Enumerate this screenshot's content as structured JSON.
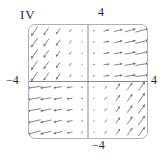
{
  "figure": {
    "panel_label": "IV",
    "axis_labels": {
      "top": "4",
      "right": "4",
      "left": "−4",
      "bottom": "−4"
    }
  },
  "chart_data": {
    "type": "vector_field",
    "title": "",
    "xlabel": "",
    "ylabel": "",
    "xlim": [
      -4,
      4
    ],
    "ylim": [
      -4,
      4
    ],
    "x_ticks_shown": {
      "min_label": "−4",
      "max_label": "4"
    },
    "y_ticks_shown": {
      "min_label": "−4",
      "max_label": "4"
    },
    "grid_x": [
      -3.6,
      -2.8,
      -2.0,
      -1.2,
      -0.4,
      0.4,
      1.2,
      2.0,
      2.8,
      3.6
    ],
    "grid_y": [
      -3.6,
      -2.8,
      -2.0,
      -1.2,
      -0.4,
      0.4,
      1.2,
      2.0,
      2.8,
      3.6
    ],
    "frame": "rounded-box",
    "axes_through_origin": true,
    "colors": {
      "arrow": "#6f6f6f",
      "axis": "#7a7a7a",
      "frame": "#b0b0b0",
      "text": "#2b2b2b",
      "background": "#ffffff"
    },
    "vectors": [
      [
        -3.6,
        3.6,
        -0.31,
        -0.442
      ],
      [
        -2.8,
        3.6,
        -0.241,
        -0.344
      ],
      [
        -2.0,
        3.6,
        -0.172,
        -0.246
      ],
      [
        -1.2,
        3.6,
        -0.103,
        -0.147
      ],
      [
        -0.4,
        3.6,
        -0.034,
        -0.049
      ],
      [
        0.4,
        3.6,
        0.076,
        0.02
      ],
      [
        1.2,
        3.6,
        0.228,
        0.06
      ],
      [
        2.0,
        3.6,
        0.38,
        0.1
      ],
      [
        2.8,
        3.6,
        0.532,
        0.14
      ],
      [
        3.6,
        3.6,
        0.684,
        0.181
      ],
      [
        -3.6,
        2.8,
        -0.31,
        -0.442
      ],
      [
        -2.8,
        2.8,
        -0.241,
        -0.344
      ],
      [
        -2.0,
        2.8,
        -0.172,
        -0.246
      ],
      [
        -1.2,
        2.8,
        -0.103,
        -0.147
      ],
      [
        -0.4,
        2.8,
        -0.034,
        -0.049
      ],
      [
        0.4,
        2.8,
        0.076,
        0.018
      ],
      [
        1.2,
        2.8,
        0.228,
        0.053
      ],
      [
        2.0,
        2.8,
        0.38,
        0.088
      ],
      [
        2.8,
        2.8,
        0.532,
        0.123
      ],
      [
        3.6,
        2.8,
        0.684,
        0.159
      ],
      [
        -3.6,
        2.0,
        -0.31,
        -0.442
      ],
      [
        -2.8,
        2.0,
        -0.241,
        -0.344
      ],
      [
        -2.0,
        2.0,
        -0.172,
        -0.246
      ],
      [
        -1.2,
        2.0,
        -0.103,
        -0.147
      ],
      [
        -0.4,
        2.0,
        -0.034,
        -0.049
      ],
      [
        0.4,
        2.0,
        0.076,
        0.015
      ],
      [
        1.2,
        2.0,
        0.228,
        0.046
      ],
      [
        2.0,
        2.0,
        0.38,
        0.076
      ],
      [
        2.8,
        2.0,
        0.532,
        0.106
      ],
      [
        3.6,
        2.0,
        0.684,
        0.137
      ],
      [
        -3.6,
        1.2,
        -0.31,
        -0.442
      ],
      [
        -2.8,
        1.2,
        -0.241,
        -0.344
      ],
      [
        -2.0,
        1.2,
        -0.172,
        -0.246
      ],
      [
        -1.2,
        1.2,
        -0.103,
        -0.147
      ],
      [
        -0.4,
        1.2,
        -0.034,
        -0.049
      ],
      [
        0.4,
        1.2,
        0.076,
        0.013
      ],
      [
        1.2,
        1.2,
        0.228,
        0.038
      ],
      [
        2.0,
        1.2,
        0.38,
        0.064
      ],
      [
        2.8,
        1.2,
        0.532,
        0.089
      ],
      [
        3.6,
        1.2,
        0.684,
        0.115
      ],
      [
        -3.6,
        0.4,
        -0.31,
        -0.442
      ],
      [
        -2.8,
        0.4,
        -0.241,
        -0.344
      ],
      [
        -2.0,
        0.4,
        -0.172,
        -0.246
      ],
      [
        -1.2,
        0.4,
        -0.103,
        -0.147
      ],
      [
        -0.4,
        0.4,
        -0.034,
        -0.049
      ],
      [
        0.4,
        0.4,
        0.076,
        0.01
      ],
      [
        1.2,
        0.4,
        0.228,
        0.031
      ],
      [
        2.0,
        0.4,
        0.38,
        0.052
      ],
      [
        2.8,
        0.4,
        0.532,
        0.072
      ],
      [
        3.6,
        0.4,
        0.684,
        0.093
      ],
      [
        -3.6,
        -0.4,
        -0.684,
        -0.093
      ],
      [
        -2.8,
        -0.4,
        -0.532,
        -0.072
      ],
      [
        -2.0,
        -0.4,
        -0.38,
        -0.052
      ],
      [
        -1.2,
        -0.4,
        -0.228,
        -0.031
      ],
      [
        -0.4,
        -0.4,
        -0.076,
        -0.01
      ],
      [
        0.4,
        -0.4,
        0.034,
        0.049
      ],
      [
        1.2,
        -0.4,
        0.103,
        0.147
      ],
      [
        2.0,
        -0.4,
        0.172,
        0.246
      ],
      [
        2.8,
        -0.4,
        0.241,
        0.344
      ],
      [
        3.6,
        -0.4,
        0.31,
        0.442
      ],
      [
        -3.6,
        -1.2,
        -0.684,
        -0.115
      ],
      [
        -2.8,
        -1.2,
        -0.532,
        -0.089
      ],
      [
        -2.0,
        -1.2,
        -0.38,
        -0.064
      ],
      [
        -1.2,
        -1.2,
        -0.228,
        -0.038
      ],
      [
        -0.4,
        -1.2,
        -0.076,
        -0.013
      ],
      [
        0.4,
        -1.2,
        0.034,
        0.049
      ],
      [
        1.2,
        -1.2,
        0.103,
        0.147
      ],
      [
        2.0,
        -1.2,
        0.172,
        0.246
      ],
      [
        2.8,
        -1.2,
        0.241,
        0.344
      ],
      [
        3.6,
        -1.2,
        0.31,
        0.442
      ],
      [
        -3.6,
        -2.0,
        -0.684,
        -0.137
      ],
      [
        -2.8,
        -2.0,
        -0.532,
        -0.106
      ],
      [
        -2.0,
        -2.0,
        -0.38,
        -0.076
      ],
      [
        -1.2,
        -2.0,
        -0.228,
        -0.046
      ],
      [
        -0.4,
        -2.0,
        -0.076,
        -0.015
      ],
      [
        0.4,
        -2.0,
        0.034,
        0.049
      ],
      [
        1.2,
        -2.0,
        0.103,
        0.147
      ],
      [
        2.0,
        -2.0,
        0.172,
        0.246
      ],
      [
        2.8,
        -2.0,
        0.241,
        0.344
      ],
      [
        3.6,
        -2.0,
        0.31,
        0.442
      ],
      [
        -3.6,
        -2.8,
        -0.684,
        -0.159
      ],
      [
        -2.8,
        -2.8,
        -0.532,
        -0.123
      ],
      [
        -2.0,
        -2.8,
        -0.38,
        -0.088
      ],
      [
        -1.2,
        -2.8,
        -0.228,
        -0.053
      ],
      [
        -0.4,
        -2.8,
        -0.076,
        -0.018
      ],
      [
        0.4,
        -2.8,
        0.034,
        0.049
      ],
      [
        1.2,
        -2.8,
        0.103,
        0.147
      ],
      [
        2.0,
        -2.8,
        0.172,
        0.246
      ],
      [
        2.8,
        -2.8,
        0.241,
        0.344
      ],
      [
        3.6,
        -2.8,
        0.31,
        0.442
      ],
      [
        -3.6,
        -3.6,
        -0.684,
        -0.181
      ],
      [
        -2.8,
        -3.6,
        -0.532,
        -0.14
      ],
      [
        -2.0,
        -3.6,
        -0.38,
        -0.1
      ],
      [
        -1.2,
        -3.6,
        -0.228,
        -0.06
      ],
      [
        -0.4,
        -3.6,
        -0.076,
        -0.02
      ],
      [
        0.4,
        -3.6,
        0.034,
        0.049
      ],
      [
        1.2,
        -3.6,
        0.103,
        0.147
      ],
      [
        2.0,
        -3.6,
        0.172,
        0.246
      ],
      [
        2.8,
        -3.6,
        0.241,
        0.344
      ],
      [
        3.6,
        -3.6,
        0.31,
        0.442
      ]
    ]
  }
}
